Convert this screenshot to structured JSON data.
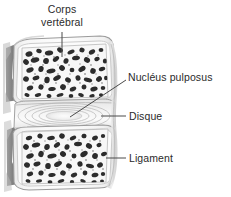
{
  "figure": {
    "background_color": "#ffffff",
    "text_color": "#2b2b2b",
    "leader_color": "#4a4a4a",
    "width": 231,
    "height": 197
  },
  "labels": [
    {
      "id": "corps-vertebral",
      "line1": "Corps",
      "line2": "vertébral",
      "full_text": "Corps vertébral"
    },
    {
      "id": "nucleus-pulposus",
      "line1": "Nucléus pulposus",
      "full_text": "Nucléus pulposus"
    },
    {
      "id": "disque",
      "line1": "Disque",
      "full_text": "Disque"
    },
    {
      "id": "ligament",
      "line1": "Ligament",
      "full_text": "Ligament"
    }
  ],
  "illustration": {
    "name": "vertebral-bodies-and-disc",
    "style": "grayscale pencil-and-wash medical illustration",
    "parts": [
      "upper vertebral body with trabecular spongy bone",
      "intervertebral disc with annulus fibrosus lamellae",
      "nucleus pulposus pale center",
      "lower vertebral body with trabecular spongy bone",
      "anterior longitudinal ligament along right margin",
      "posterior vertebral notches on left margin"
    ]
  }
}
